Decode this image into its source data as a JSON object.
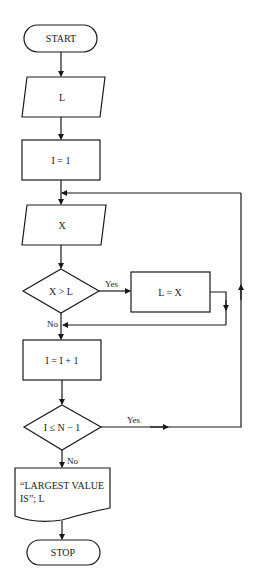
{
  "diagram": {
    "type": "flowchart",
    "nodes": {
      "start": {
        "label": "START",
        "shape": "terminator"
      },
      "input_l": {
        "label": "L",
        "shape": "input-output"
      },
      "init_i": {
        "label": "I = 1",
        "shape": "process"
      },
      "input_x": {
        "label": "X",
        "shape": "input-output"
      },
      "decision_xl": {
        "label": "X > L",
        "shape": "decision"
      },
      "assign_l": {
        "label": "L = X",
        "shape": "process"
      },
      "increment_i": {
        "label": "I = I + 1",
        "shape": "process"
      },
      "decision_loop": {
        "label": "I ≤ N − 1",
        "shape": "decision"
      },
      "output": {
        "line1": "“LARGEST VALUE",
        "line2": "IS”; L",
        "shape": "document"
      },
      "stop": {
        "label": "STOP",
        "shape": "terminator"
      }
    },
    "edges": {
      "xl_yes": "Yes",
      "xl_no": "No",
      "loop_yes": "Yes",
      "loop_no": "No"
    }
  }
}
